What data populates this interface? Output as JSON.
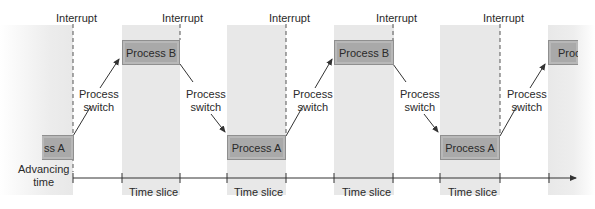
{
  "diagram": {
    "interrupt_label": "Interrupt",
    "process_switch_label_line1": "Process",
    "process_switch_label_line2": "switch",
    "axis_label_line1": "Advancing",
    "axis_label_line2": "time",
    "time_slice_label": "Time slice",
    "processes": {
      "a_partial_left": "ss A",
      "b1": "Process B",
      "a1": "Process A",
      "b2": "Process B",
      "a2": "Process A",
      "b_partial_right": "Proc"
    },
    "colors": {
      "slice_shade": "#e8e8e8",
      "process_fill": "#a9a9a9",
      "process_border": "#8f8f8f",
      "line": "#333333"
    }
  }
}
